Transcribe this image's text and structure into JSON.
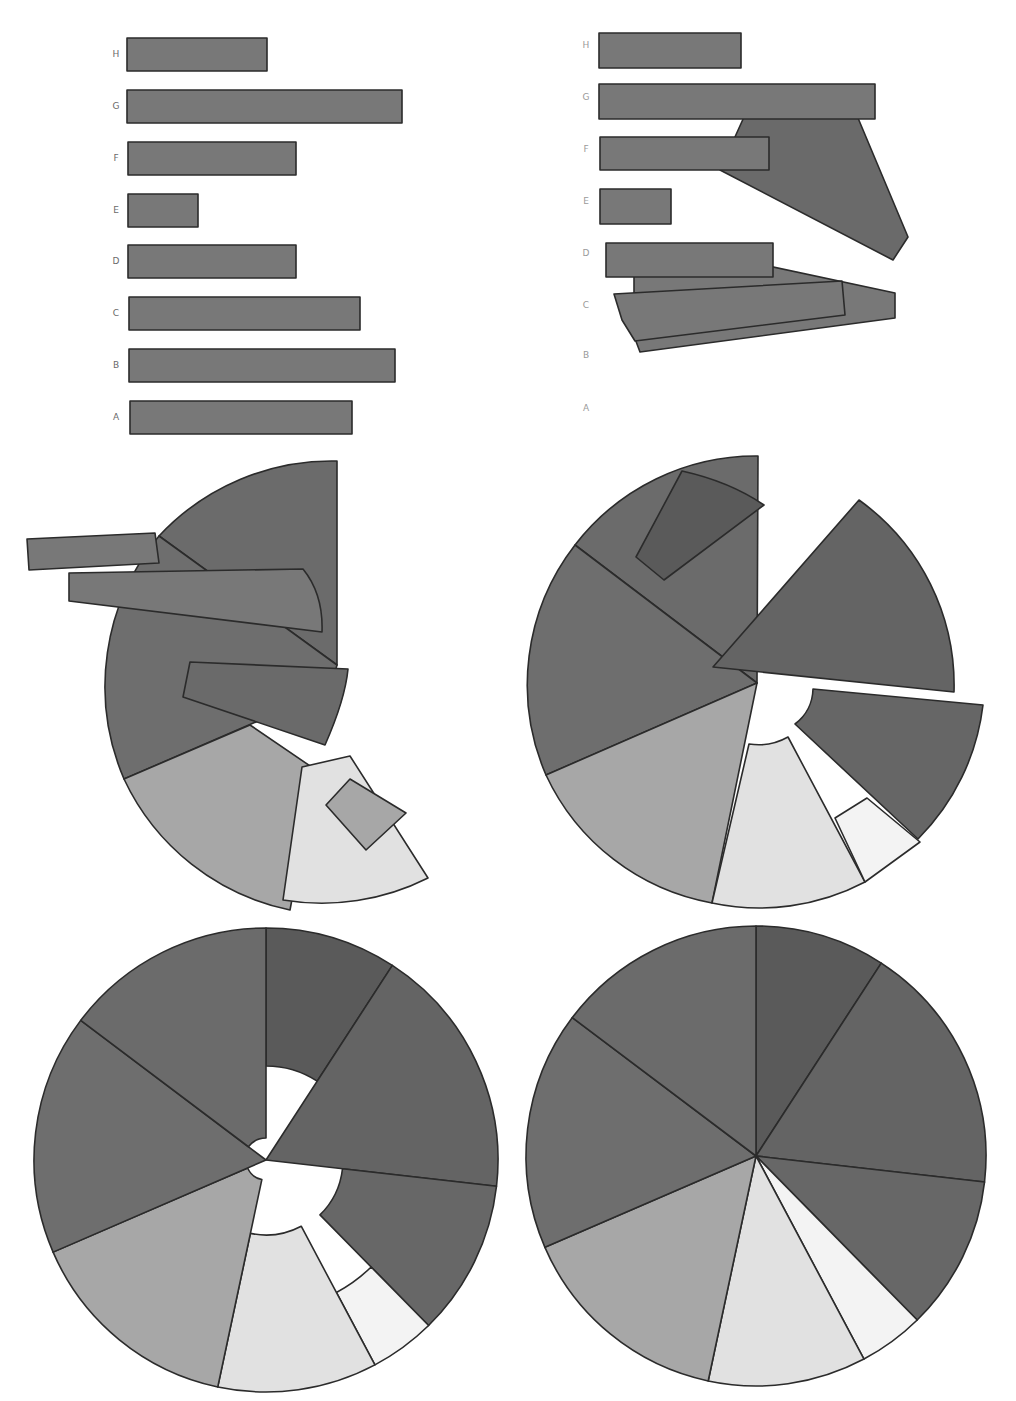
{
  "chart_data": [
    {
      "panel": "top-left",
      "type": "bar",
      "orientation": "horizontal",
      "categories": [
        "A",
        "B",
        "C",
        "D",
        "E",
        "F",
        "G",
        "H"
      ],
      "values": [
        224,
        268,
        232,
        169,
        71,
        168,
        275,
        140
      ],
      "title": "",
      "xlabel": "",
      "ylabel": "",
      "grid": false,
      "bar_color": "#787878"
    },
    {
      "panel": "top-right",
      "type": "bar",
      "description": "bars beginning to morph into pie slices (A and B already moved)",
      "categories": [
        "A",
        "B",
        "C",
        "D",
        "E",
        "F",
        "G",
        "H"
      ],
      "visible_bar_values": {
        "C": 232,
        "D": 169,
        "E": 71,
        "F": 168,
        "G": 275,
        "H": 140
      }
    },
    {
      "panel": "middle-left",
      "type": "pie",
      "description": "transition: partial pie with remaining bars rotating into slices"
    },
    {
      "panel": "middle-right",
      "type": "pie",
      "description": "transition: exploded pie slices moving into place"
    },
    {
      "panel": "bottom-left",
      "type": "pie",
      "description": "transition: slices with varying inner radii converging to center"
    },
    {
      "panel": "bottom-right",
      "type": "pie",
      "categories": [
        "H",
        "G",
        "F",
        "E",
        "D",
        "C",
        "B",
        "A"
      ],
      "values": [
        140,
        275,
        168,
        71,
        169,
        232,
        268,
        224
      ],
      "slice_angles_deg": [
        33,
        63.5,
        39,
        16.5,
        40,
        54.6,
        60.4,
        53
      ],
      "start_angle": "12 o'clock, clockwise",
      "colors": {
        "H": "#5a5a5a",
        "G": "#646464",
        "F": "#676767",
        "E": "#f3f3f3",
        "D": "#e1e1e1",
        "C": "#a7a7a7",
        "B": "#6e6e6e",
        "A": "#6b6b6b"
      }
    }
  ],
  "bars_left": {
    "x0": 127,
    "items": [
      {
        "label": "H",
        "y": 38,
        "w": 140,
        "x": 127
      },
      {
        "label": "G",
        "y": 90,
        "w": 275,
        "x": 127
      },
      {
        "label": "F",
        "y": 142,
        "w": 168,
        "x": 128
      },
      {
        "label": "E",
        "y": 194,
        "w": 70,
        "x": 128
      },
      {
        "label": "D",
        "y": 245,
        "w": 168,
        "x": 128
      },
      {
        "label": "C",
        "y": 297,
        "w": 231,
        "x": 129
      },
      {
        "label": "B",
        "y": 349,
        "w": 266,
        "x": 129
      },
      {
        "label": "A",
        "y": 401,
        "w": 222,
        "x": 130
      }
    ],
    "bar_height": 33,
    "label_x": 116,
    "label_color": "#6a6a6a"
  },
  "bars_right": {
    "label_x": 586,
    "label_color": "#9a9a9a",
    "labels": [
      {
        "label": "H",
        "y": 45
      },
      {
        "label": "G",
        "y": 97
      },
      {
        "label": "F",
        "y": 149
      },
      {
        "label": "E",
        "y": 201
      },
      {
        "label": "D",
        "y": 253
      },
      {
        "label": "C",
        "y": 305
      },
      {
        "label": "B",
        "y": 355
      },
      {
        "label": "A",
        "y": 408
      }
    ],
    "shapes": [
      {
        "name": "bar-slice-b-morph",
        "fill": "#787878",
        "pts": "634,272 750,262 895,293 895,318 640,352 634,336"
      },
      {
        "name": "bar-slice-g-morph",
        "fill": "#6a6a6a",
        "pts": "744,117 858,118 908,237 893,260 720,170"
      },
      {
        "name": "bar-h",
        "fill": "#787878",
        "pts": "599,33 741,33 741,68 599,68"
      },
      {
        "name": "bar-g",
        "fill": "#787878",
        "pts": "599,84 875,84 875,119 599,119"
      },
      {
        "name": "bar-f",
        "fill": "#787878",
        "pts": "600,137 769,137 769,170 600,170"
      },
      {
        "name": "bar-e",
        "fill": "#787878",
        "pts": "600,189 671,189 671,224 600,224"
      },
      {
        "name": "bar-d",
        "fill": "#787878",
        "pts": "606,243 773,243 773,277 606,277"
      },
      {
        "name": "bar-c-morph",
        "fill": "#787878",
        "pts": "614,294 842,281 845,315 635,341 622,320"
      }
    ]
  },
  "panel_middle_left": {
    "shapes": [
      {
        "name": "slice-a",
        "fill": "#6b6b6b",
        "d": "M337,665 L337,461 A236,236 0 0 0 159,536 Z"
      },
      {
        "name": "slice-b",
        "fill": "#6e6e6e",
        "d": "M337,665 L159,536 A236,236 0 0 0 124,779 L330,690 Z"
      },
      {
        "name": "slice-c",
        "fill": "#a7a7a7",
        "d": "M250,725 L124,779 A236,236 0 0 0 290,910 L316,770 Z"
      },
      {
        "name": "slice-d",
        "fill": "#e1e1e1",
        "d": "M302,767 L350,756 L428,878 A236,236 0 0 1 283,900 Z"
      },
      {
        "name": "piece-e",
        "fill": "#a7a7a7",
        "d": "M326,805 L350,779 L406,813 L366,850 Z"
      },
      {
        "name": "piece-f",
        "fill": "#6a6a6a",
        "d": "M183,697 L190,662 L348,669 C346,690 340,711 325,745 Z"
      },
      {
        "name": "piece-g",
        "fill": "#787878",
        "d": "M69,601 L69,573 L303,569 C316,585 323,605 322,632 Z"
      },
      {
        "name": "piece-h",
        "fill": "#787878",
        "d": "M27,539 L155,533 L159,563 L29,570 Z"
      }
    ]
  },
  "panel_middle_right": {
    "shapes": [
      {
        "name": "slice-a",
        "fill": "#6b6b6b",
        "d": "M757,683 L758,456 A228,228 0 0 0 575,545 Z"
      },
      {
        "name": "slice-b",
        "fill": "#6e6e6e",
        "d": "M757,683 L575,545 A228,228 0 0 0 546,775 Z"
      },
      {
        "name": "slice-c",
        "fill": "#a7a7a7",
        "d": "M757,683 L546,775 A228,228 0 0 0 712,903 Z"
      },
      {
        "name": "slice-d",
        "fill": "#e1e1e1",
        "d": "M749,744 L712,903 A228,228 0 0 0 865,882 L788,737 A60,60 0 0 1 749,744 Z"
      },
      {
        "name": "slice-e",
        "fill": "#f3f3f3",
        "d": "M835,818 L865,882 L920,842 L867,798 Z"
      },
      {
        "name": "slice-f",
        "fill": "#666666",
        "d": "M795,724 A45,45 0 0 0 813,689 L983,705 A228,228 0 0 1 918,839 Z"
      },
      {
        "name": "slice-g",
        "fill": "#646464",
        "d": "M713,667 L859,500 A228,228 0 0 1 954,692 Z"
      },
      {
        "name": "piece-h",
        "fill": "#5a5a5a",
        "d": "M636,557 L682,471 C718,479 745,492 764,505 L664,580 Z"
      }
    ]
  },
  "panel_bottom_left": {
    "cx": 266,
    "cy": 1160,
    "r": 232,
    "slices": [
      {
        "name": "slice-h",
        "fill": "#5a5a5a",
        "a0": 0,
        "a1": 33,
        "rin": 94
      },
      {
        "name": "slice-g",
        "fill": "#646464",
        "a0": 33,
        "a1": 96.5,
        "rin": 0
      },
      {
        "name": "slice-f",
        "fill": "#676767",
        "a0": 96.5,
        "a1": 135.5,
        "rin": 77
      },
      {
        "name": "slice-e",
        "fill": "#f3f3f3",
        "a0": 135.5,
        "a1": 152,
        "rin": 150
      },
      {
        "name": "slice-d",
        "fill": "#e1e1e1",
        "a0": 152,
        "a1": 192,
        "rin": 75
      },
      {
        "name": "slice-c",
        "fill": "#a7a7a7",
        "a0": 192,
        "a1": 246.6,
        "rin": 20
      },
      {
        "name": "slice-b",
        "fill": "#6e6e6e",
        "a0": 246.6,
        "a1": 307,
        "rin": 0
      },
      {
        "name": "slice-a",
        "fill": "#6b6b6b",
        "a0": 307,
        "a1": 360,
        "rin": 22
      }
    ]
  },
  "panel_bottom_right": {
    "cx": 756,
    "cy": 1156,
    "r": 230,
    "slices": [
      {
        "name": "slice-h",
        "fill": "#5a5a5a",
        "a0": 0,
        "a1": 33,
        "rin": 0
      },
      {
        "name": "slice-g",
        "fill": "#646464",
        "a0": 33,
        "a1": 96.5,
        "rin": 0
      },
      {
        "name": "slice-f",
        "fill": "#676767",
        "a0": 96.5,
        "a1": 135.5,
        "rin": 0
      },
      {
        "name": "slice-e",
        "fill": "#f3f3f3",
        "a0": 135.5,
        "a1": 152,
        "rin": 0
      },
      {
        "name": "slice-d",
        "fill": "#e1e1e1",
        "a0": 152,
        "a1": 192,
        "rin": 0
      },
      {
        "name": "slice-c",
        "fill": "#a7a7a7",
        "a0": 192,
        "a1": 246.6,
        "rin": 0
      },
      {
        "name": "slice-b",
        "fill": "#6e6e6e",
        "a0": 246.6,
        "a1": 307,
        "rin": 0
      },
      {
        "name": "slice-a",
        "fill": "#6b6b6b",
        "a0": 307,
        "a1": 360,
        "rin": 0
      }
    ]
  }
}
